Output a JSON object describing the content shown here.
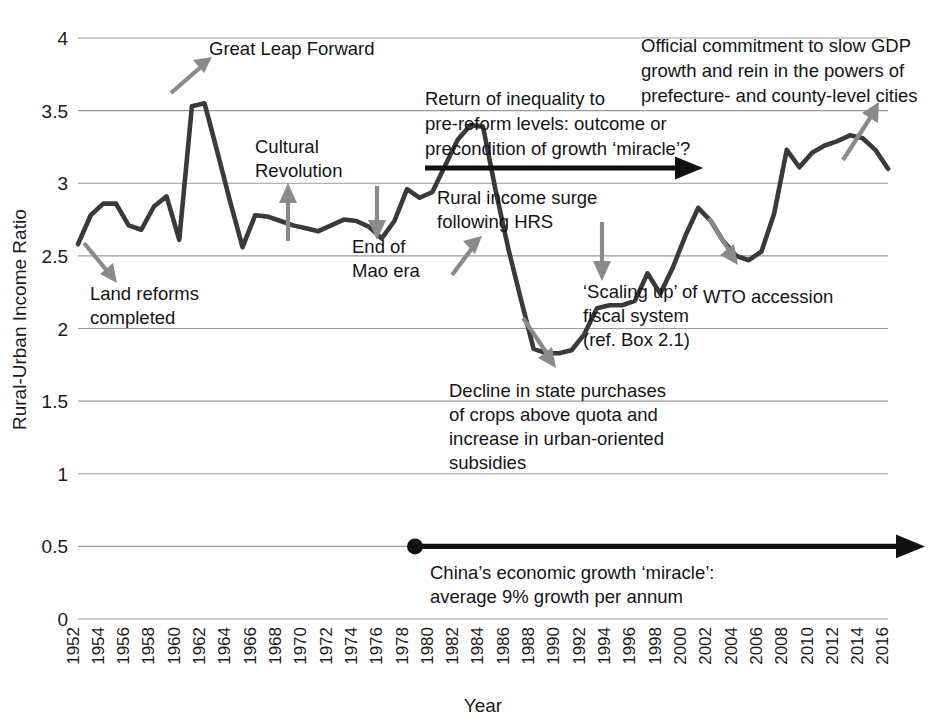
{
  "chart_data": {
    "type": "line",
    "title": "",
    "xlabel": "Year",
    "ylabel": "Rural-Urban Income Ratio",
    "ylim": [
      0,
      4
    ],
    "xlim": [
      1952,
      2016
    ],
    "yticks": [
      "0",
      "0.5",
      "1",
      "1.5",
      "2",
      "2.5",
      "3",
      "3.5",
      "4"
    ],
    "ytick_values": [
      0,
      0.5,
      1,
      1.5,
      2,
      2.5,
      3,
      3.5,
      4
    ],
    "grid": "horizontal",
    "legend": "none",
    "xticks": [
      "1952",
      "1954",
      "1956",
      "1958",
      "1960",
      "1962",
      "1964",
      "1966",
      "1968",
      "1970",
      "1972",
      "1974",
      "1976",
      "1978",
      "1980",
      "1982",
      "1984",
      "1986",
      "1988",
      "1990",
      "1992",
      "1994",
      "1996",
      "1998",
      "2000",
      "2002",
      "2004",
      "2006",
      "2008",
      "2010",
      "2012",
      "2014",
      "2016"
    ],
    "series": [
      {
        "name": "Rural-Urban Income Ratio",
        "color": "#3a3a3a",
        "x": [
          1952,
          1953,
          1954,
          1955,
          1956,
          1957,
          1958,
          1959,
          1960,
          1961,
          1962,
          1963,
          1964,
          1965,
          1966,
          1967,
          1968,
          1969,
          1970,
          1971,
          1972,
          1973,
          1974,
          1975,
          1976,
          1977,
          1978,
          1979,
          1980,
          1981,
          1982,
          1983,
          1984,
          1985,
          1986,
          1987,
          1988,
          1989,
          1990,
          1991,
          1992,
          1993,
          1994,
          1995,
          1996,
          1997,
          1998,
          1999,
          2000,
          2001,
          2002,
          2003,
          2004,
          2005,
          2006,
          2007,
          2008,
          2009,
          2010,
          2011,
          2012,
          2013,
          2014,
          2015,
          2016
        ],
        "values": [
          2.58,
          2.78,
          2.86,
          2.86,
          2.71,
          2.68,
          2.84,
          2.91,
          2.61,
          3.53,
          3.55,
          3.22,
          2.88,
          2.56,
          2.78,
          2.77,
          2.74,
          2.71,
          2.69,
          2.67,
          2.71,
          2.75,
          2.74,
          2.7,
          2.62,
          2.74,
          2.96,
          2.9,
          2.94,
          3.12,
          3.3,
          3.4,
          3.39,
          2.95,
          2.55,
          2.2,
          1.86,
          1.83,
          1.83,
          1.85,
          1.96,
          2.14,
          2.16,
          2.16,
          2.19,
          2.38,
          2.24,
          2.42,
          2.64,
          2.83,
          2.74,
          2.6,
          2.5,
          2.47,
          2.53,
          2.79,
          3.23,
          3.11,
          3.21,
          3.26,
          3.29,
          3.33,
          3.31,
          3.23,
          3.1
        ],
        "values_note": "Values read off the 0-4 axis with 0.5 gridlines; a sharp Great Leap Forward spike to ~3.55 around 1960-61, a trough of ~1.83 in the mid-1980s, and a late peak of ~3.3 around 2008-2009 before declining to ~2.7 by 2016"
      }
    ],
    "annotations": [
      {
        "id": "great-leap-forward",
        "text": "Great Leap Forward",
        "lines": [
          "Great Leap Forward"
        ],
        "arrow": "up-right",
        "arrow_color": "#8a8a8a"
      },
      {
        "id": "cultural-revolution",
        "text": "Cultural Revolution",
        "lines": [
          "Cultural",
          "Revolution"
        ],
        "arrow": "up",
        "arrow_color": "#8a8a8a"
      },
      {
        "id": "land-reforms-completed",
        "text": "Land reforms completed",
        "lines": [
          "Land reforms",
          "completed"
        ],
        "arrow": "down-right",
        "arrow_color": "#8a8a8a"
      },
      {
        "id": "end-of-mao-era",
        "text": "End of Mao era",
        "lines": [
          "End of",
          "Mao era"
        ],
        "arrow": "down",
        "arrow_color": "#8a8a8a"
      },
      {
        "id": "rural-income-surge",
        "text": "Rural income surge following HRS",
        "lines": [
          "Rural income surge",
          "following HRS"
        ],
        "arrow": "up-right",
        "arrow_color": "#8a8a8a"
      },
      {
        "id": "return-of-inequality",
        "text": "Return of inequality to pre-reform levels: outcome or precondition of growth 'miracle'?",
        "lines": [
          "Return of inequality to",
          "pre-reform levels: outcome or",
          "precondition of growth ‘miracle’?"
        ],
        "arrow": "right-black",
        "arrow_color": "#111111"
      },
      {
        "id": "official-commitment",
        "text": "Official commitment to slow GDP growth and rein in the powers of prefecture- and county-level cities",
        "lines": [
          "Official commitment to slow GDP",
          "growth and rein in the powers of",
          "prefecture- and county-level cities"
        ],
        "arrow": "up-right",
        "arrow_color": "#8a8a8a"
      },
      {
        "id": "scaling-up-fiscal-system",
        "text": "'Scaling up' of fiscal system (ref. Box 2.1)",
        "lines": [
          "‘Scaling up’ of",
          "fiscal system",
          "(ref. Box 2.1)"
        ],
        "arrow": "down",
        "arrow_color": "#8a8a8a"
      },
      {
        "id": "decline-in-state-purchases",
        "text": "Decline in state purchases of crops above quota and increase in urban-oriented subsidies",
        "lines": [
          "Decline in state purchases",
          "of crops above quota and",
          "increase in urban-oriented",
          "subsidies"
        ],
        "arrow": "down-right",
        "arrow_color": "#8a8a8a"
      },
      {
        "id": "wto-accession",
        "text": "WTO accession",
        "lines": [
          "WTO accession"
        ],
        "arrow": "down-right",
        "arrow_color": "#8a8a8a"
      },
      {
        "id": "china-growth-miracle",
        "text": "China's economic growth 'miracle': average 9% growth per annum",
        "lines": [
          "China’s economic growth ‘miracle’:",
          "average 9% growth per annum"
        ],
        "arrow": "right-black-timeline",
        "arrow_color": "#111111",
        "start_year": 1978,
        "end_year": 2016
      }
    ]
  },
  "axis": {
    "y_title": "Rural-Urban Income Ratio",
    "x_title": "Year",
    "y_ticks": [
      "4",
      "3.5",
      "3",
      "2.5",
      "2",
      "1.5",
      "1",
      "0.5",
      "0"
    ],
    "x_ticks": [
      "1952",
      "1954",
      "1956",
      "1958",
      "1960",
      "1962",
      "1964",
      "1966",
      "1968",
      "1970",
      "1972",
      "1974",
      "1976",
      "1978",
      "1980",
      "1982",
      "1984",
      "1986",
      "1988",
      "1990",
      "1992",
      "1994",
      "1996",
      "1998",
      "2000",
      "2002",
      "2004",
      "2006",
      "2008",
      "2010",
      "2012",
      "2014",
      "2016"
    ]
  },
  "annotations": {
    "great_leap_forward": "Great Leap Forward",
    "cultural_revolution_1": "Cultural",
    "cultural_revolution_2": "Revolution",
    "land_reforms_1": "Land reforms",
    "land_reforms_2": "completed",
    "end_of_mao_1": "End of",
    "end_of_mao_2": "Mao era",
    "rural_income_1": "Rural income surge",
    "rural_income_2": "following HRS",
    "return_inequality_1": "Return of inequality to",
    "return_inequality_2": "pre-reform levels: outcome or",
    "return_inequality_3": "precondition of growth ‘miracle’?",
    "official_commitment_1": "Official commitment to slow GDP",
    "official_commitment_2": "growth and rein in the powers of",
    "official_commitment_3": "prefecture- and county-level cities",
    "scaling_up_1": "‘Scaling up’ of",
    "scaling_up_2": "fiscal system",
    "scaling_up_3": "(ref. Box 2.1)",
    "decline_state_1": "Decline in state purchases",
    "decline_state_2": "of crops above quota and",
    "decline_state_3": "increase in urban-oriented",
    "decline_state_4": "subsidies",
    "wto_accession": "WTO accession",
    "china_miracle_1": "China’s economic growth ‘miracle’:",
    "china_miracle_2": "average 9% growth per annum"
  },
  "colors": {
    "line": "#3a3a3a",
    "grid": "#9a9a9a",
    "annotation_arrow": "#8a8a8a",
    "black_arrow": "#111111",
    "text": "#1a1a1a",
    "background": "#ffffff"
  }
}
